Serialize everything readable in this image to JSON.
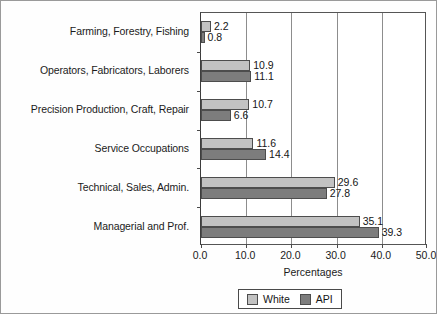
{
  "chart_data": {
    "type": "bar",
    "orientation": "horizontal",
    "title": "",
    "xlabel": "Percentages",
    "ylabel": "",
    "xlim": [
      0.0,
      50.0
    ],
    "xticks": [
      "0.0",
      "10.0",
      "20.0",
      "30.0",
      "40.0",
      "50.0"
    ],
    "xtick_values": [
      0,
      10,
      20,
      30,
      40,
      50
    ],
    "grid": true,
    "legend_position": "bottom",
    "categories": [
      "Farming, Forestry, Fishing",
      "Operators, Fabricators, Laborers",
      "Precision Production, Craft, Repair",
      "Service Occupations",
      "Technical, Sales, Admin.",
      "Managerial and Prof."
    ],
    "series": [
      {
        "name": "White",
        "color": "#c2c2c2",
        "values": [
          2.2,
          10.9,
          10.7,
          11.6,
          29.6,
          35.1
        ],
        "labels": [
          "2.2",
          "10.9",
          "10.7",
          "11.6",
          "29.6",
          "35.1"
        ]
      },
      {
        "name": "API",
        "color": "#7d7d7d",
        "values": [
          0.8,
          11.1,
          6.6,
          14.4,
          27.8,
          39.3
        ],
        "labels": [
          "0.8",
          "11.1",
          "6.6",
          "14.4",
          "27.8",
          "39.3"
        ]
      }
    ]
  }
}
